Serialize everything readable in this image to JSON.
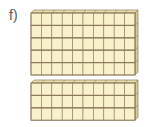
{
  "problem": {
    "label": "f)",
    "description": "Base-ten blocks representing tens rods",
    "groups": [
      {
        "name": "top-group",
        "rows": 5,
        "columns": 10
      },
      {
        "name": "bottom-group",
        "rows": 3,
        "columns": 10
      }
    ],
    "total_rods": 8,
    "unit_cubes_per_rod": 10
  },
  "colors": {
    "face": "#f9f1cc",
    "top_face": "#ebdfae",
    "side_face": "#d9cb96",
    "line": "#8b7b5b"
  }
}
